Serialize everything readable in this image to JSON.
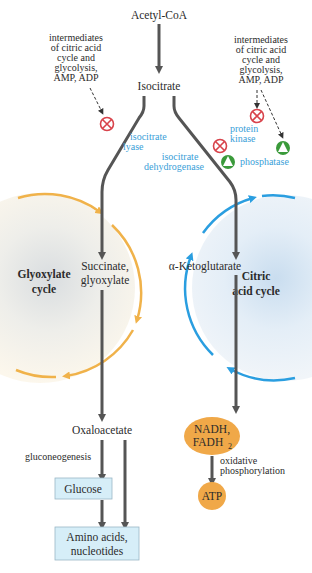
{
  "diagram": {
    "nodes": {
      "acetyl_coa": "Acetyl-CoA",
      "isocitrate": "Isocitrate",
      "succinate": "Succinate,",
      "glyoxylate": "glyoxylate",
      "ketoglutarate": "α-Ketoglutarate",
      "oxaloacetate": "Oxaloacetate",
      "glucose": "Glucose",
      "amino1": "Amino acids,",
      "amino2": "nucleotides",
      "nadh": "NADH,",
      "fadh": "FADH",
      "fadh_sub": "2",
      "atp": "ATP"
    },
    "cycles": {
      "glyoxylate_1": "Glyoxylate",
      "glyoxylate_2": "cycle",
      "citric_1": "Citric",
      "citric_2": "acid cycle"
    },
    "left_regulators": [
      "intermediates",
      "of citric acid",
      "cycle and",
      "glycolysis,",
      "AMP, ADP"
    ],
    "right_regulators": [
      "intermediates",
      "of citric acid",
      "cycle and",
      "glycolysis,",
      "AMP, ADP"
    ],
    "enzymes": {
      "lyase_1": "isocitrate",
      "lyase_2": "lyase",
      "dehyd_1": "isocitrate",
      "dehyd_2": "dehydrogenase",
      "kinase_1": "protein",
      "kinase_2": "kinase",
      "phosphatase": "phosphatase"
    },
    "process_labels": {
      "gluconeogenesis": "gluconeogenesis",
      "oxphos_1": "oxidative",
      "oxphos_2": "phosphorylation"
    },
    "colors": {
      "arrow": "#555555",
      "glyoxylate_cycle": "#f0b24a",
      "citric_cycle": "#2a9ee0",
      "inhibit": "#d8434b",
      "activate": "#3a9a3a",
      "enzyme_text": "#3aa0d8",
      "energy_node": "#f0a848",
      "box_fill": "#d6eef8"
    }
  }
}
